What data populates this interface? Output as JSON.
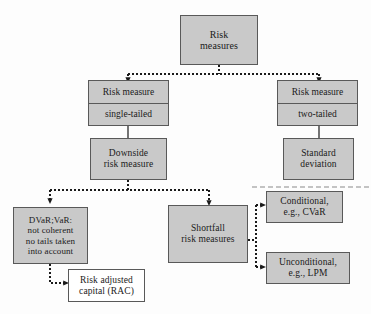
{
  "diagram": {
    "colors": {
      "node_fill": "#c9c9c9",
      "node_fill_alt": "#ffffff",
      "node_border": "#595959",
      "connector": "#1a1a1a",
      "background": "#fdfdfd"
    },
    "nodes": {
      "root": {
        "line1": "Risk",
        "line2": "measures"
      },
      "single_tailed": {
        "header": "Risk measure",
        "body": "single-tailed"
      },
      "two_tailed": {
        "header": "Risk measure",
        "body": "two-tailed"
      },
      "downside": {
        "line1": "Downside",
        "line2": "risk measure"
      },
      "standard_deviation": {
        "line1": "Standard",
        "line2": "deviation"
      },
      "dvar_var": {
        "line1": "DVaR;VaR:",
        "line2": "not coherent",
        "line3": "no tails taken",
        "line4": "into account"
      },
      "rac": {
        "line1": "Risk adjusted",
        "line2": "capital (RAC)"
      },
      "shortfall": {
        "line1": "Shortfall",
        "line2": "risk measures"
      },
      "conditional": {
        "line1": "Conditional,",
        "line2": "e.g., CVaR"
      },
      "unconditional": {
        "line1": "Unconditional,",
        "line2": "e.g., LPM"
      }
    }
  }
}
